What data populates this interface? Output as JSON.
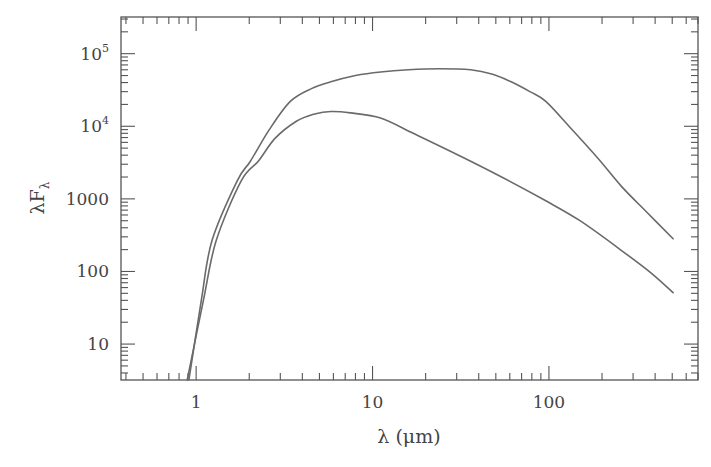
{
  "chart_data": {
    "type": "line",
    "title": "",
    "xlabel": "λ (μm)",
    "ylabel": "λF_λ",
    "xscale": "log",
    "yscale": "log",
    "xlim": [
      0.375,
      700
    ],
    "ylim": [
      3.2,
      320000
    ],
    "grid": false,
    "legend": null,
    "x_ticks": [
      {
        "value": 1,
        "label": "1"
      },
      {
        "value": 10,
        "label": "10"
      },
      {
        "value": 100,
        "label": "100"
      }
    ],
    "y_ticks": [
      {
        "value": 10,
        "label": "10",
        "base": "",
        "exp": ""
      },
      {
        "value": 100,
        "label": "100",
        "base": "",
        "exp": ""
      },
      {
        "value": 1000,
        "label": "1000",
        "base": "",
        "exp": ""
      },
      {
        "value": 10000,
        "label": "",
        "base": "10",
        "exp": "4"
      },
      {
        "value": 100000,
        "label": "",
        "base": "10",
        "exp": "5"
      }
    ],
    "series": [
      {
        "name": "upper curve",
        "points": [
          [
            0.91,
            3.2
          ],
          [
            1.07,
            40
          ],
          [
            1.23,
            266
          ],
          [
            1.71,
            1770
          ],
          [
            2.03,
            3300
          ],
          [
            2.6,
            9000
          ],
          [
            3.42,
            22000
          ],
          [
            4.5,
            33000
          ],
          [
            5.8,
            41000
          ],
          [
            8.0,
            50000
          ],
          [
            11.1,
            56000
          ],
          [
            16,
            60000
          ],
          [
            24,
            62000
          ],
          [
            36,
            60000
          ],
          [
            48,
            52000
          ],
          [
            61,
            41000
          ],
          [
            78,
            30000
          ],
          [
            96,
            22000
          ],
          [
            133,
            9400
          ],
          [
            190,
            3600
          ],
          [
            257,
            1500
          ],
          [
            360,
            650
          ],
          [
            506,
            282
          ]
        ]
      },
      {
        "name": "lower curve",
        "points": [
          [
            0.89,
            3.2
          ],
          [
            1.1,
            40
          ],
          [
            1.3,
            266
          ],
          [
            1.8,
            1770
          ],
          [
            2.25,
            3300
          ],
          [
            2.8,
            6800
          ],
          [
            3.7,
            11700
          ],
          [
            4.7,
            14800
          ],
          [
            5.8,
            16000
          ],
          [
            7.5,
            15300
          ],
          [
            11.1,
            13000
          ],
          [
            17,
            8000
          ],
          [
            27.8,
            4500
          ],
          [
            50,
            2200
          ],
          [
            96,
            940
          ],
          [
            150,
            500
          ],
          [
            257,
            196
          ],
          [
            380,
            95
          ],
          [
            506,
            51
          ]
        ]
      }
    ]
  }
}
